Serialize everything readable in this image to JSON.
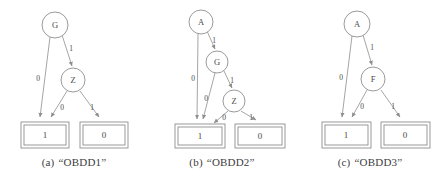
{
  "figure": {
    "type": "obdd-diagram-set",
    "panel_count": 3,
    "colors": {
      "stroke": "#8e8e8e",
      "text": "#4a4a4a",
      "background": "#ffffff"
    }
  },
  "panels": [
    {
      "id": "a",
      "caption_tag": "(a)",
      "caption_name": "“OBDD1”",
      "nodes": [
        {
          "id": "root",
          "label": "G",
          "cx": 55,
          "cy": 25,
          "r": 13
        },
        {
          "id": "mid",
          "label": "Z",
          "cx": 73,
          "cy": 80,
          "r": 12
        }
      ],
      "terminals": [
        {
          "id": "t1",
          "label": "1",
          "x": 21,
          "y": 122,
          "w": 48,
          "h": 26
        },
        {
          "id": "t0",
          "label": "0",
          "x": 80,
          "y": 122,
          "w": 48,
          "h": 26
        }
      ],
      "edges": [
        {
          "from": "root",
          "to": "t1",
          "label": "0",
          "lx": 38,
          "ly": 78
        },
        {
          "from": "root",
          "to": "mid",
          "label": "1",
          "lx": 71,
          "ly": 48
        },
        {
          "from": "mid",
          "to": "t1",
          "label": "0",
          "lx": 62,
          "ly": 107
        },
        {
          "from": "mid",
          "to": "t0",
          "label": "1",
          "lx": 92,
          "ly": 107
        }
      ]
    },
    {
      "id": "b",
      "caption_tag": "(b)",
      "caption_name": "“OBDD2”",
      "nodes": [
        {
          "id": "root",
          "label": "A",
          "cx": 53,
          "cy": 22,
          "r": 12
        },
        {
          "id": "mid",
          "label": "G",
          "cx": 69,
          "cy": 62,
          "r": 11
        },
        {
          "id": "low",
          "label": "Z",
          "cx": 86,
          "cy": 101,
          "r": 11
        }
      ],
      "terminals": [
        {
          "id": "t1",
          "label": "1",
          "x": 27,
          "y": 124,
          "w": 50,
          "h": 24
        },
        {
          "id": "t0",
          "label": "0",
          "x": 87,
          "y": 124,
          "w": 50,
          "h": 24
        }
      ],
      "edges": [
        {
          "from": "root",
          "to": "t1",
          "label": "0",
          "lx": 48,
          "ly": 78
        },
        {
          "from": "root",
          "to": "mid",
          "label": "1",
          "lx": 66,
          "ly": 40
        },
        {
          "from": "mid",
          "to": "t1",
          "label": "0",
          "lx": 64,
          "ly": 98
        },
        {
          "from": "mid",
          "to": "low",
          "label": "1",
          "lx": 84,
          "ly": 80
        },
        {
          "from": "low",
          "to": "t1",
          "label": "0",
          "lx": 76,
          "ly": 117
        },
        {
          "from": "low",
          "to": "t0",
          "label": "1",
          "lx": 103,
          "ly": 117
        }
      ]
    },
    {
      "id": "c",
      "caption_tag": "(c)",
      "caption_name": "“OBDD3”",
      "nodes": [
        {
          "id": "root",
          "label": "A",
          "cx": 61,
          "cy": 24,
          "r": 13
        },
        {
          "id": "mid",
          "label": "F",
          "cx": 77,
          "cy": 79,
          "r": 12
        }
      ],
      "terminals": [
        {
          "id": "t1",
          "label": "1",
          "x": 26,
          "y": 122,
          "w": 49,
          "h": 26
        },
        {
          "id": "t0",
          "label": "0",
          "x": 85,
          "y": 122,
          "w": 49,
          "h": 26
        }
      ],
      "edges": [
        {
          "from": "root",
          "to": "t1",
          "label": "0",
          "lx": 45,
          "ly": 77
        },
        {
          "from": "root",
          "to": "mid",
          "label": "1",
          "lx": 76,
          "ly": 47
        },
        {
          "from": "mid",
          "to": "t1",
          "label": "0",
          "lx": 66,
          "ly": 106
        },
        {
          "from": "mid",
          "to": "t0",
          "label": "1",
          "lx": 97,
          "ly": 106
        }
      ]
    }
  ]
}
